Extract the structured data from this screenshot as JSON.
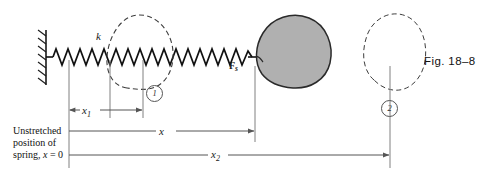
{
  "figure": {
    "caption": "Fig. 18–8",
    "spring_constant_label": "k",
    "force_label": "F",
    "force_label_subscript": "s",
    "position_marker_1": "1",
    "position_marker_2": "2",
    "dimension_x1": "x",
    "dimension_x1_subscript": "1",
    "dimension_x": "x",
    "dimension_x2": "x",
    "dimension_x2_subscript": "2",
    "origin_note_line1": "Unstretched",
    "origin_note_line2": "position of",
    "origin_note_line3_prefix": "spring, ",
    "origin_note_line3_var": "x",
    "origin_note_line3_suffix": " = 0"
  },
  "colors": {
    "mass_fill": "#b0b0b0",
    "mass_stroke": "#2a2a2a",
    "line": "#707070",
    "ink": "#111111",
    "dashed": "#4a4a4a",
    "wall": "#1a1a1a"
  },
  "geometry": {
    "wall_x": 46,
    "origin_x": 69,
    "pos1_x": 110,
    "pos1_end_x": 143,
    "spring_axis_y": 57,
    "mass_center_x": 282,
    "mass_attach_x": 255,
    "ghost2_center_x": 390,
    "x_line_y": 131,
    "x1_line_y": 110,
    "x2_line_y": 155
  }
}
